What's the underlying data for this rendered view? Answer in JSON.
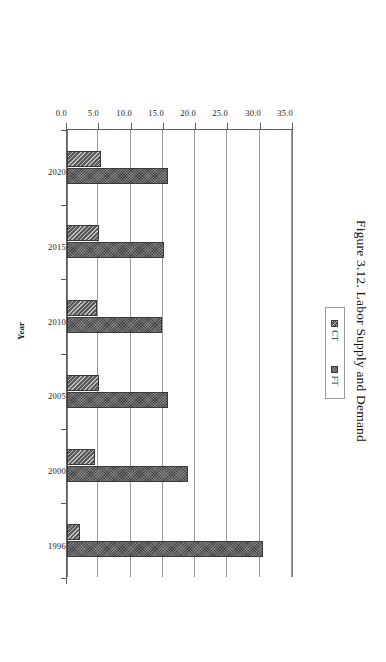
{
  "figure": {
    "caption": "Figure 3.12. Labor Supply and Demand",
    "orientation_note": "chart printed rotated 90 degrees clockwise on the page"
  },
  "legend": {
    "position": "inside-right",
    "entries": [
      {
        "label": "CT",
        "swatch_color": "#5a5a5a",
        "icon": "legend-swatch-icon"
      },
      {
        "label": "FT",
        "swatch_color": "#3f3f3f",
        "icon": "legend-swatch-icon"
      }
    ]
  },
  "axes": {
    "category_axis_title": "Year",
    "value_ticks": [
      "0.0",
      "5.0",
      "10.0",
      "15.0",
      "20.0",
      "25.0",
      "30.0",
      "35.0"
    ]
  },
  "chart_data": {
    "type": "bar",
    "title": "Figure 3.12. Labor Supply and Demand",
    "categories": [
      "2020",
      "2015",
      "2010",
      "2005",
      "2000",
      "1996"
    ],
    "series": [
      {
        "name": "CT",
        "values": [
          5.2,
          4.9,
          4.7,
          4.9,
          4.3,
          2.0
        ],
        "color": "#5a5a5a"
      },
      {
        "name": "FT",
        "values": [
          15.6,
          15.0,
          14.7,
          15.6,
          18.7,
          30.3
        ],
        "color": "#3f3f3f"
      }
    ],
    "xlabel": "Year",
    "ylabel": "",
    "ylim": [
      0.0,
      35.0
    ],
    "ytick_step": 5.0,
    "grid": true,
    "legend_position": "inside-right",
    "orientation": "vertical-bars-rotated-page"
  }
}
